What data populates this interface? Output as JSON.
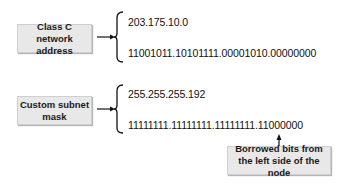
{
  "diagram": {
    "groups": [
      {
        "label": "Class C network address",
        "label_lines": [
          "Class C network",
          "address"
        ],
        "values": [
          "203.175.10.0",
          "11001011.10101111.00001010.00000000"
        ]
      },
      {
        "label": "Custom subnet mask",
        "label_lines": [
          "Custom subnet",
          "mask"
        ],
        "values": [
          "255.255.255.192",
          "11111111.11111111.11111111.11000000"
        ]
      }
    ],
    "callout": {
      "label_lines": [
        "Borrowed bits from",
        "the left side of the node"
      ]
    },
    "colors": {
      "box_fill": "#e8e8e8",
      "line": "#111111"
    }
  }
}
